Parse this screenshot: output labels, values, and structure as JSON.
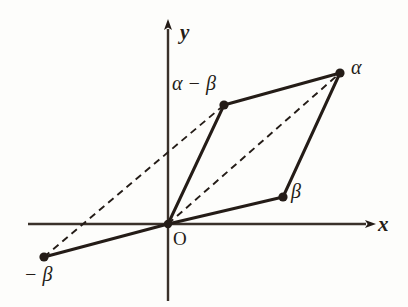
{
  "figure": {
    "background_color": "#fdfdfb",
    "stroke_color": "#241c17",
    "axes": {
      "x_label": "x",
      "y_label": "y",
      "origin_label": "O",
      "x_axis_y": 224,
      "y_axis_x": 168,
      "x_start": 28,
      "x_end": 372,
      "y_start": 22,
      "y_end": 301
    },
    "points": [
      {
        "id": "alpha",
        "label": "α",
        "x": 340,
        "y": 73,
        "label_x": 351,
        "label_y": 58
      },
      {
        "id": "alpha-beta",
        "label": "α − β",
        "x": 224,
        "y": 105,
        "label_x": 173,
        "label_y": 74
      },
      {
        "id": "beta",
        "label": "β",
        "x": 283,
        "y": 197,
        "label_x": 291,
        "label_y": 182
      },
      {
        "id": "neg-beta",
        "label": "− β",
        "x": 44,
        "y": 257,
        "label_x": 25,
        "label_y": 265
      },
      {
        "id": "origin",
        "label": "O",
        "x": 168,
        "y": 224,
        "label_x": 173,
        "label_y": 229
      }
    ],
    "solid_edges": [
      {
        "id": "origin-to-alpha-minus-beta",
        "x1": 168,
        "y1": 224,
        "x2": 224,
        "y2": 105
      },
      {
        "id": "alpha-minus-beta-to-alpha",
        "x1": 224,
        "y1": 105,
        "x2": 340,
        "y2": 73
      },
      {
        "id": "origin-to-beta",
        "x1": 168,
        "y1": 224,
        "x2": 283,
        "y2": 197
      },
      {
        "id": "beta-to-alpha",
        "x1": 283,
        "y1": 197,
        "x2": 340,
        "y2": 73
      },
      {
        "id": "origin-to-neg-beta",
        "x1": 168,
        "y1": 224,
        "x2": 44,
        "y2": 257
      }
    ],
    "dashed_edges": [
      {
        "id": "origin-to-alpha-diagonal",
        "x1": 168,
        "y1": 224,
        "x2": 340,
        "y2": 73
      },
      {
        "id": "neg-beta-to-alpha-minus-beta",
        "x1": 44,
        "y1": 257,
        "x2": 224,
        "y2": 105
      }
    ]
  }
}
